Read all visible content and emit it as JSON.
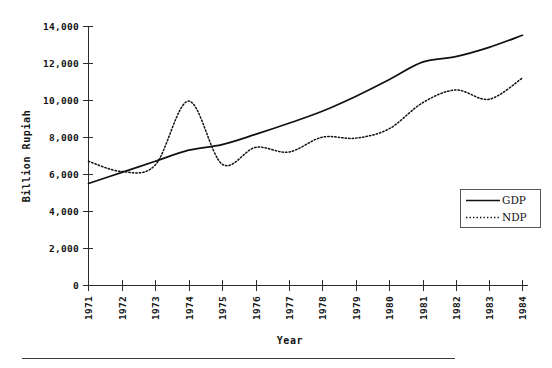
{
  "chart_data": {
    "type": "line",
    "title": "",
    "xlabel": "Year",
    "ylabel": "Billion Rupiah",
    "categories": [
      "1971",
      "1972",
      "1973",
      "1974",
      "1975",
      "1976",
      "1977",
      "1978",
      "1979",
      "1980",
      "1981",
      "1982",
      "1983",
      "1984"
    ],
    "x": [
      1971,
      1972,
      1973,
      1974,
      1975,
      1976,
      1977,
      1978,
      1979,
      1980,
      1981,
      1982,
      1983,
      1984
    ],
    "series": [
      {
        "name": "GDP",
        "style": "solid",
        "color": "#111111",
        "values": [
          5500,
          6100,
          6700,
          7300,
          7600,
          8150,
          8750,
          9400,
          10200,
          11100,
          12050,
          12350,
          12850,
          13500
        ]
      },
      {
        "name": "NDP",
        "style": "dotted",
        "color": "#111111",
        "values": [
          6700,
          6150,
          6500,
          9950,
          6550,
          7450,
          7200,
          8000,
          7950,
          8450,
          9850,
          10550,
          10050,
          11200
        ]
      }
    ],
    "ylim": [
      0,
      14000
    ],
    "xlim": [
      1971,
      1984
    ],
    "ytick_labels": [
      "0",
      "2,000",
      "4,000",
      "6,000",
      "8,000",
      "10,000",
      "12,000",
      "14,000"
    ],
    "ytick_values": [
      0,
      2000,
      4000,
      6000,
      8000,
      10000,
      12000,
      14000
    ],
    "xtick_labels": [
      "1971",
      "1972",
      "1973",
      "1974",
      "1975",
      "1976",
      "1977",
      "1978",
      "1979",
      "1980",
      "1981",
      "1982",
      "1983",
      "1984"
    ],
    "grid": false,
    "legend_position": "center-right",
    "legend_entries": [
      "GDP",
      "NDP"
    ],
    "xtick_rotation": -90
  },
  "axes": {
    "y_title": "Billion Rupiah",
    "x_title": "Year"
  },
  "legend": {
    "entries": [
      {
        "label": "GDP",
        "style": "solid"
      },
      {
        "label": "NDP",
        "style": "dotted"
      }
    ]
  }
}
